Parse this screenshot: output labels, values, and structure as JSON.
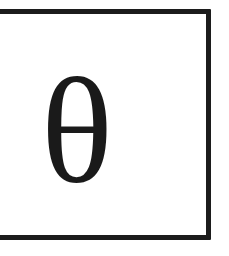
{
  "card": {
    "symbol": "θ",
    "symbol_name": "theta",
    "border_color": "#1c1c1c",
    "text_color": "#1a1a1a",
    "background_color": "#ffffff"
  }
}
